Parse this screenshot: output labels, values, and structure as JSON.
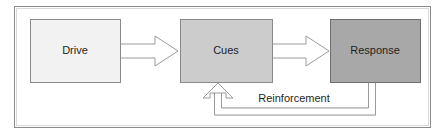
{
  "diagram": {
    "frame": {
      "border_color": "#8a8a8a",
      "inner_border_color": "#d8d8d8",
      "background": "#ffffff"
    },
    "nodes": [
      {
        "id": "drive",
        "label": "Drive",
        "fill": "#f2f2f2",
        "stroke": "#8a8a8a",
        "x": 30,
        "y": 19,
        "width": 90,
        "height": 63
      },
      {
        "id": "cues",
        "label": "Cues",
        "fill": "#cccccc",
        "stroke": "#8a8a8a",
        "x": 180,
        "y": 19,
        "width": 92,
        "height": 63
      },
      {
        "id": "response",
        "label": "Response",
        "fill": "#a8a8a8",
        "stroke": "#6e6e6e",
        "x": 330,
        "y": 19,
        "width": 90,
        "height": 63
      }
    ],
    "arrows": [
      {
        "id": "drive-to-cues",
        "from": "drive",
        "to": "cues",
        "direction": "right",
        "style": "outlined-block-arrow",
        "fill": "#ffffff",
        "stroke": "#9a9a9a"
      },
      {
        "id": "cues-to-response",
        "from": "cues",
        "to": "response",
        "direction": "right",
        "style": "outlined-block-arrow",
        "fill": "#ffffff",
        "stroke": "#9a9a9a"
      },
      {
        "id": "reinforcement-to-cues",
        "from": "response",
        "to": "cues",
        "direction": "up",
        "style": "outlined-block-arrow",
        "fill": "#ffffff",
        "stroke": "#9a9a9a",
        "label": "Reinforcement"
      }
    ],
    "edge_labels": [
      {
        "id": "reinforcement",
        "text": "Reinforcement",
        "x": 293,
        "y": 99
      }
    ]
  }
}
